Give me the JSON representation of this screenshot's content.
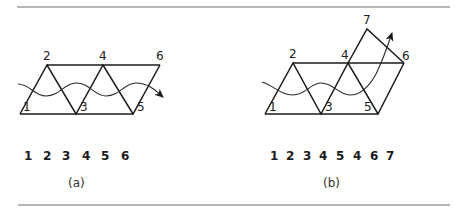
{
  "figure": {
    "panels": [
      {
        "id": "a",
        "caption": "(a)",
        "vertices": [
          {
            "label": "1",
            "x": 20,
            "y": 114
          },
          {
            "label": "2",
            "x": 47,
            "y": 65
          },
          {
            "label": "3",
            "x": 76,
            "y": 114
          },
          {
            "label": "4",
            "x": 103,
            "y": 65
          },
          {
            "label": "5",
            "x": 133,
            "y": 114
          },
          {
            "label": "6",
            "x": 160,
            "y": 65
          }
        ],
        "sequence": [
          "1",
          "2",
          "3",
          "4",
          "5",
          "6"
        ],
        "description": "Strip of triangles (triangle strip) traversed by a wavy arrow left to right"
      },
      {
        "id": "b",
        "caption": "(b)",
        "vertices": [
          {
            "label": "1",
            "x": 265,
            "y": 114
          },
          {
            "label": "2",
            "x": 293,
            "y": 63
          },
          {
            "label": "3",
            "x": 321,
            "y": 114
          },
          {
            "label": "4",
            "x": 348,
            "y": 63
          },
          {
            "label": "5",
            "x": 378,
            "y": 114
          },
          {
            "label": "6",
            "x": 404,
            "y": 63
          },
          {
            "label": "7",
            "x": 367,
            "y": 29
          }
        ],
        "sequence": [
          "1",
          "2",
          "3",
          "4",
          "5",
          "4",
          "6",
          "7"
        ],
        "description": "Triangle strip with a turn requiring a repeated vertex (4); wavy arrow bends upward"
      }
    ]
  }
}
